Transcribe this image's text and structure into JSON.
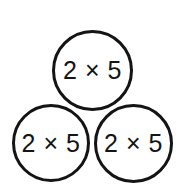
{
  "canvas": {
    "width": 182,
    "height": 185,
    "background_color": "#ffffff",
    "stroke_color": "#141414",
    "text_color": "#141414"
  },
  "diagram": {
    "name": "three-circles-multiplication-expression",
    "arrangement": "triangle",
    "circles": [
      {
        "position": "top",
        "expression": "2 × 5",
        "center_x": 92,
        "center_y": 70,
        "diameter": 81
      },
      {
        "position": "bottom-left",
        "expression": "2 × 5",
        "center_x": 51,
        "center_y": 143,
        "diameter": 78
      },
      {
        "position": "bottom-right",
        "expression": "2 × 5",
        "center_x": 133,
        "center_y": 143,
        "diameter": 79
      }
    ]
  }
}
